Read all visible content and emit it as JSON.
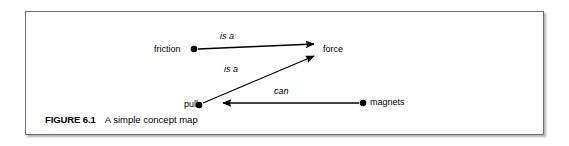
{
  "figure": {
    "caption_number": "FIGURE 6.1",
    "caption_text": "A simple concept map",
    "border_color": "#6f6f6f",
    "background": "#ffffff",
    "ink_color": "#000000"
  },
  "diagram": {
    "type": "concept-map",
    "nodes": [
      {
        "id": "friction",
        "label": "friction",
        "dot_x": 168,
        "dot_y": 37
      },
      {
        "id": "force",
        "label": "force",
        "dot_x": 292,
        "dot_y": 37
      },
      {
        "id": "pull",
        "label": "pull",
        "dot_x": 173,
        "dot_y": 93
      },
      {
        "id": "magnets",
        "label": "magnets",
        "dot_x": 337,
        "dot_y": 90
      }
    ],
    "edges": [
      {
        "id": "friction-is-a-force",
        "from": "friction",
        "to": "force",
        "label": "is a",
        "arrow": "to"
      },
      {
        "id": "pull-is-a-force",
        "from": "pull",
        "to": "force",
        "label": "is a",
        "arrow": "to"
      },
      {
        "id": "magnets-can-pull",
        "from": "magnets",
        "to": "pull",
        "label": "can",
        "arrow": "to"
      }
    ],
    "labels": {
      "friction": "friction",
      "force": "force",
      "pull": "pull",
      "magnets": "magnets",
      "is_a_upper": "is a",
      "is_a_lower": "is a",
      "can": "can"
    }
  }
}
